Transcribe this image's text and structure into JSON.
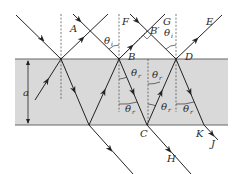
{
  "colors": {
    "slab_fill": "#d9d9d9",
    "slab_edge": "#666666",
    "ray": "#222222",
    "background": "#ffffff"
  },
  "labels": {
    "A": "A",
    "B": "B",
    "B_prime": "B′",
    "C": "C",
    "D": "D",
    "E": "E",
    "F": "F",
    "G": "G",
    "H": "H",
    "J": "J",
    "K": "K",
    "thickness": "a"
  },
  "angles": {
    "incident": {
      "symbol": "θ",
      "subscript": "i"
    },
    "refracted": {
      "symbol": "θ",
      "subscript": "r"
    }
  }
}
